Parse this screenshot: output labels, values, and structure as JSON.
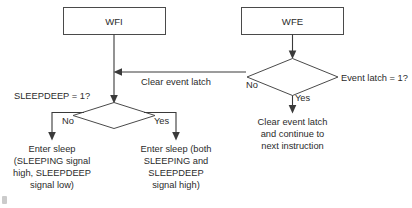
{
  "diagram": {
    "background_color": "#ffffff",
    "line_color": "#3a3a3a",
    "box_stroke_color": "#4a4a4a",
    "text_color": "#2b2b2b",
    "nodes": {
      "wfi_box": "WFI",
      "wfe_box": "WFE",
      "sleepdeep_diamond_label": "SLEEPDEEP = 1?",
      "event_latch_diamond_label": "Event latch = 1?"
    },
    "edge_labels": {
      "clear_event_latch": "Clear event latch",
      "event_latch_no": "No",
      "event_latch_yes": "Yes",
      "sleepdeep_no": "No",
      "sleepdeep_yes": "Yes"
    },
    "terminals": {
      "sleep_normal": [
        "Enter sleep",
        "(SLEEPING signal",
        "high, SLEEPDEEP",
        "signal low)"
      ],
      "sleep_deep": [
        "Enter sleep (both",
        "SLEEPING and",
        "SLEEPDEEP",
        "signal high)"
      ],
      "continue_exec": [
        "Clear event latch",
        "and continue to",
        "next instruction"
      ]
    }
  }
}
